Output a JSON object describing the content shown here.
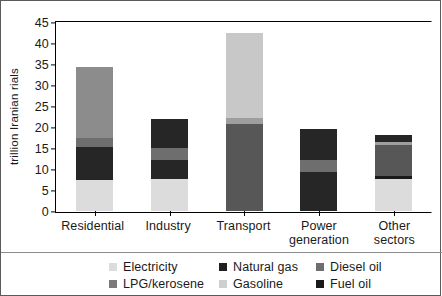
{
  "chart_data": {
    "type": "bar",
    "subtype": "stacked-bar",
    "title": "",
    "xlabel": "",
    "ylabel": "trillion Iranian rials",
    "ylim": [
      0,
      45
    ],
    "ytick_step": 5,
    "yticks": [
      "45",
      "40",
      "35",
      "30",
      "25",
      "20",
      "15",
      "10",
      "5",
      "0"
    ],
    "grid": false,
    "legend_position": "bottom",
    "categories": [
      "Residential",
      "Industry",
      "Transport",
      "Power generation",
      "Other sectors"
    ],
    "series": [
      {
        "name": "Electricity",
        "color": "#dcdcdc",
        "values": [
          7.2,
          7.5,
          0.0,
          0.0,
          7.4
        ]
      },
      {
        "name": "Natural gas",
        "color": "#262626",
        "values": [
          8.0,
          11.5,
          0.0,
          16.5,
          1.6
        ]
      },
      {
        "name": "Diesel oil",
        "color": "#8c8c8c",
        "values": [
          16.9,
          2.7,
          20.6,
          2.9,
          7.4
        ]
      },
      {
        "name": "LPG/kerosene",
        "color": "#6e6e6e",
        "values": [
          2.1,
          0.0,
          1.4,
          0.0,
          0.7
        ]
      },
      {
        "name": "Gasoline",
        "color": "#c8c8c8",
        "values": [
          0.0,
          0.0,
          20.3,
          0.0,
          0.0
        ]
      },
      {
        "name": "Fuel oil",
        "color": "#1a1a1a",
        "values": [
          0.0,
          0.0,
          0.0,
          0.0,
          0.8
        ]
      }
    ],
    "totals": [
      34.2,
      21.7,
      42.3,
      19.4,
      17.9
    ],
    "stacks": [
      {
        "category": "Residential",
        "segments": [
          {
            "series": "Electricity",
            "from": 0.0,
            "to": 7.2,
            "value": 7.2,
            "color": "#dcdcdc"
          },
          {
            "series": "Natural gas",
            "from": 7.2,
            "to": 15.2,
            "value": 8.0,
            "color": "#262626"
          },
          {
            "series": "LPG/kerosene",
            "from": 15.2,
            "to": 17.3,
            "value": 2.1,
            "color": "#6e6e6e"
          },
          {
            "series": "Diesel oil",
            "from": 17.3,
            "to": 34.2,
            "value": 16.9,
            "color": "#8c8c8c"
          }
        ]
      },
      {
        "category": "Industry",
        "segments": [
          {
            "series": "Electricity",
            "from": 0.0,
            "to": 7.5,
            "value": 7.5,
            "color": "#dcdcdc"
          },
          {
            "series": "Natural gas",
            "from": 7.5,
            "to": 12.1,
            "value": 4.6,
            "color": "#262626"
          },
          {
            "series": "Diesel oil",
            "from": 12.1,
            "to": 14.8,
            "value": 2.7,
            "color": "#6e6e6e"
          },
          {
            "series": "Natural gas",
            "from": 14.8,
            "to": 21.7,
            "value": 6.9,
            "color": "#262626"
          }
        ]
      },
      {
        "category": "Transport",
        "segments": [
          {
            "series": "Diesel oil",
            "from": 0.0,
            "to": 20.6,
            "value": 20.6,
            "color": "#575757"
          },
          {
            "series": "LPG/kerosene",
            "from": 20.6,
            "to": 22.0,
            "value": 1.4,
            "color": "#9e9e9e"
          },
          {
            "series": "Gasoline",
            "from": 22.0,
            "to": 42.3,
            "value": 20.3,
            "color": "#c8c8c8"
          }
        ]
      },
      {
        "category": "Power generation",
        "segments": [
          {
            "series": "Natural gas",
            "from": 0.0,
            "to": 9.2,
            "value": 9.2,
            "color": "#262626"
          },
          {
            "series": "Diesel oil",
            "from": 9.2,
            "to": 12.1,
            "value": 2.9,
            "color": "#6e6e6e"
          },
          {
            "series": "Natural gas",
            "from": 12.1,
            "to": 19.4,
            "value": 7.3,
            "color": "#262626"
          }
        ]
      },
      {
        "category": "Other sectors",
        "segments": [
          {
            "series": "Electricity",
            "from": 0.0,
            "to": 7.4,
            "value": 7.4,
            "color": "#dcdcdc"
          },
          {
            "series": "Fuel oil",
            "from": 7.4,
            "to": 8.2,
            "value": 0.8,
            "color": "#1a1a1a"
          },
          {
            "series": "Diesel oil",
            "from": 8.2,
            "to": 15.6,
            "value": 7.4,
            "color": "#575757"
          },
          {
            "series": "LPG/kerosene",
            "from": 15.6,
            "to": 16.3,
            "value": 0.7,
            "color": "#9e9e9e"
          },
          {
            "series": "Natural gas",
            "from": 16.3,
            "to": 17.9,
            "value": 1.6,
            "color": "#262626"
          }
        ]
      }
    ]
  },
  "axis": {
    "y_title": "trillion Iranian rials",
    "y_ticks": [
      "45",
      "40",
      "35",
      "30",
      "25",
      "20",
      "15",
      "10",
      "5",
      "0"
    ],
    "x_labels": [
      {
        "line1": "Residential",
        "line2": ""
      },
      {
        "line1": "Industry",
        "line2": ""
      },
      {
        "line1": "Transport",
        "line2": ""
      },
      {
        "line1": "Power",
        "line2": "generation"
      },
      {
        "line1": "Other",
        "line2": "sectors"
      }
    ]
  },
  "legend": {
    "row1": [
      {
        "label": "Electricity",
        "color": "#dcdcdc"
      },
      {
        "label": "Natural gas",
        "color": "#1f1f1f"
      },
      {
        "label": "Diesel oil",
        "color": "#6e6e6e"
      }
    ],
    "row2": [
      {
        "label": "LPG/kerosene",
        "color": "#7a7a7a"
      },
      {
        "label": "Gasoline",
        "color": "#cfcfcf"
      },
      {
        "label": "Fuel oil",
        "color": "#1a1a1a"
      }
    ]
  }
}
